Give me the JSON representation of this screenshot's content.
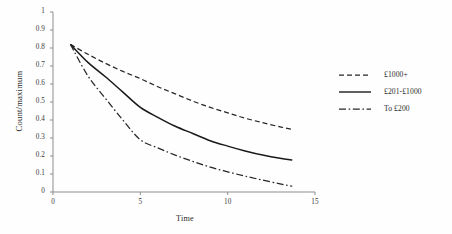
{
  "chart_data": {
    "type": "line",
    "title": "",
    "xlabel": "Time",
    "ylabel": "Count/maximum",
    "xlim": [
      0,
      15
    ],
    "ylim": [
      0,
      1
    ],
    "xticks": [
      "0",
      "5",
      "10",
      "15"
    ],
    "xtick_values": [
      0,
      5,
      10,
      15
    ],
    "yticks": [
      "0",
      "0.1",
      "0.2",
      "0.3",
      "0.4",
      "0.5",
      "0.6",
      "0.7",
      "0.8",
      "0.9",
      "1"
    ],
    "ytick_values": [
      0,
      0.1,
      0.2,
      0.3,
      0.4,
      0.5,
      0.6,
      0.7,
      0.8,
      0.9,
      1
    ],
    "grid": false,
    "legend_position": "right",
    "x": [
      1,
      2,
      3,
      4,
      5,
      6,
      7,
      8,
      9,
      10,
      11,
      12,
      13,
      13.7
    ],
    "series": [
      {
        "name": "£1000+",
        "style": "dashed",
        "color": "#262626",
        "values": [
          0.82,
          0.765,
          0.715,
          0.67,
          0.63,
          0.585,
          0.545,
          0.505,
          0.47,
          0.44,
          0.41,
          0.385,
          0.362,
          0.348
        ]
      },
      {
        "name": "£201-£1000",
        "style": "solid",
        "color": "#1a1a1a",
        "values": [
          0.82,
          0.72,
          0.64,
          0.555,
          0.47,
          0.415,
          0.365,
          0.325,
          0.285,
          0.255,
          0.228,
          0.205,
          0.187,
          0.178
        ]
      },
      {
        "name": "To £200",
        "style": "dashdot",
        "color": "#262626",
        "values": [
          0.82,
          0.645,
          0.52,
          0.4,
          0.29,
          0.245,
          0.205,
          0.17,
          0.138,
          0.112,
          0.088,
          0.066,
          0.045,
          0.032
        ]
      }
    ]
  },
  "axes": {
    "ylabel": "Count/maximum",
    "xlabel": "Time"
  },
  "legend": {
    "items": [
      {
        "label": "£1000+",
        "key": "dashed-line-key"
      },
      {
        "label": "£201-£1000",
        "key": "solid-line-key"
      },
      {
        "label": "To £200",
        "key": "dashdot-line-key"
      }
    ]
  }
}
